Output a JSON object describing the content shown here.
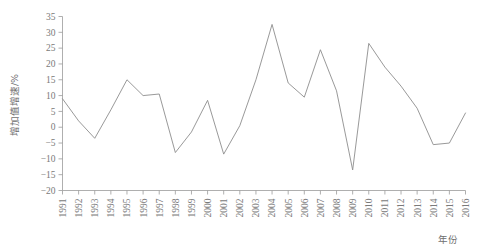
{
  "chart_data": {
    "type": "line",
    "title": "",
    "xlabel": "年份",
    "ylabel": "增加值增速/%",
    "xlim": [
      1991,
      2016
    ],
    "ylim": [
      -20,
      35
    ],
    "ytick_step": 5,
    "grid": false,
    "legend": "none",
    "line_color": "#8d8d8d",
    "categories": [
      "1991",
      "1992",
      "1993",
      "1994",
      "1995",
      "1996",
      "1997",
      "1998",
      "1999",
      "2000",
      "2001",
      "2002",
      "2003",
      "2004",
      "2005",
      "2006",
      "2007",
      "2008",
      "2009",
      "2010",
      "2011",
      "2012",
      "2013",
      "2014",
      "2015",
      "2016"
    ],
    "yticks": [
      "35",
      "30",
      "25",
      "20",
      "15",
      "10",
      "5",
      "0",
      "-5",
      "-10",
      "-15",
      "-20"
    ],
    "ytick_values": [
      35,
      30,
      25,
      20,
      15,
      10,
      5,
      0,
      -5,
      -10,
      -15,
      -20
    ],
    "series": [
      {
        "name": "增加值增速",
        "values": [
          9.0,
          2.0,
          -3.5,
          5.5,
          15.0,
          10.0,
          10.5,
          -8.0,
          -1.5,
          8.5,
          -8.5,
          0.5,
          15.0,
          32.5,
          14.0,
          9.5,
          24.5,
          11.5,
          -13.5,
          26.5,
          19.0,
          13.0,
          6.0,
          -5.5,
          -5.0,
          4.5
        ]
      }
    ]
  }
}
